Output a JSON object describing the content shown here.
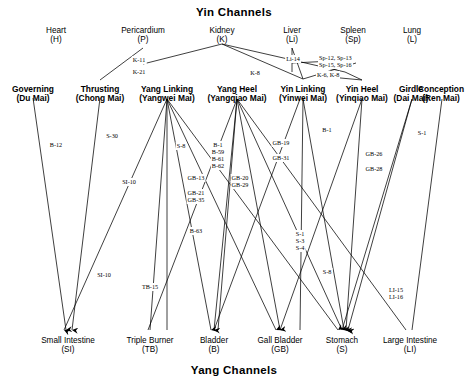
{
  "titles": {
    "top": "Yin Channels",
    "bottom": "Yang Channels"
  },
  "yin_organs": [
    {
      "id": "heart",
      "name": "Heart",
      "abbr": "(H)",
      "x": 56,
      "y": 30
    },
    {
      "id": "pericardium",
      "name": "Pericardium",
      "abbr": "(P)",
      "x": 143,
      "y": 30
    },
    {
      "id": "kidney",
      "name": "Kidney",
      "abbr": "(K)",
      "x": 222,
      "y": 30
    },
    {
      "id": "liver",
      "name": "Liver",
      "abbr": "(Li)",
      "x": 292,
      "y": 30
    },
    {
      "id": "spleen",
      "name": "Spleen",
      "abbr": "(Sp)",
      "x": 353,
      "y": 30
    },
    {
      "id": "lung",
      "name": "Lung",
      "abbr": "(L)",
      "x": 412,
      "y": 30
    }
  ],
  "vessels": [
    {
      "id": "governing",
      "name": "Governing",
      "alt": "(Du Mai)",
      "x": 33,
      "y": 88
    },
    {
      "id": "thrusting",
      "name": "Thrusting",
      "alt": "(Chong Mai)",
      "x": 100,
      "y": 88
    },
    {
      "id": "yang-linking",
      "name": "Yang Linking",
      "alt": "(Yangwei Mai)",
      "x": 167,
      "y": 88
    },
    {
      "id": "yang-heel",
      "name": "Yang Heel",
      "alt": "(Yangqiao Mai)",
      "x": 237,
      "y": 88
    },
    {
      "id": "yin-linking",
      "name": "Yin Linking",
      "alt": "(Yinwei Mai)",
      "x": 303,
      "y": 88
    },
    {
      "id": "yin-heel",
      "name": "Yin Heel",
      "alt": "(Yinqiao Mai)",
      "x": 362,
      "y": 88
    },
    {
      "id": "girdle",
      "name": "Girdle",
      "alt": "(Dai Mai)",
      "x": 412,
      "y": 88
    },
    {
      "id": "conception",
      "name": "Conception",
      "alt": "(Ren Mai)",
      "x": 442,
      "y": 88
    }
  ],
  "yang_organs": [
    {
      "id": "small-intestine",
      "name": "Small Intestine",
      "abbr": "(SI)",
      "x": 68,
      "y": 342
    },
    {
      "id": "triple-burner",
      "name": "Triple Burner",
      "abbr": "(TB)",
      "x": 150,
      "y": 342
    },
    {
      "id": "bladder",
      "name": "Bladder",
      "abbr": "(B)",
      "x": 214,
      "y": 342
    },
    {
      "id": "gall-bladder",
      "name": "Gall Bladder",
      "abbr": "(GB)",
      "x": 280,
      "y": 342
    },
    {
      "id": "stomach",
      "name": "Stomach",
      "abbr": "(S)",
      "x": 342,
      "y": 342
    },
    {
      "id": "large-intestine",
      "name": "Large Intestine",
      "abbr": "(LI)",
      "x": 410,
      "y": 342
    }
  ],
  "point_labels": [
    {
      "id": "k-11",
      "text": "K-11",
      "x": 139,
      "y": 59
    },
    {
      "id": "k-21",
      "text": "K-21",
      "x": 139,
      "y": 70
    },
    {
      "id": "k-8",
      "text": "K-8",
      "x": 255,
      "y": 71
    },
    {
      "id": "li-14",
      "text": "Li-14",
      "x": 293,
      "y": 57
    },
    {
      "id": "sp-12-13",
      "text": "Sp-12, Sp-13",
      "x": 344,
      "y": 56
    },
    {
      "id": "sp-15-16",
      "text": "Sp-15, Sp-16",
      "x": 344,
      "y": 63
    },
    {
      "id": "k-6-k-8",
      "text": "K-6, K-8",
      "x": 339,
      "y": 74
    },
    {
      "id": "b-12",
      "text": "B-12",
      "x": 56,
      "y": 143
    },
    {
      "id": "s-30",
      "text": "S-30",
      "x": 112,
      "y": 134
    },
    {
      "id": "si-10-upper",
      "text": "SI-10",
      "x": 129,
      "y": 180
    },
    {
      "id": "s-8",
      "text": "S-8",
      "x": 181,
      "y": 144
    },
    {
      "id": "b-1",
      "text": "B-1",
      "x": 218,
      "y": 143
    },
    {
      "id": "b-59",
      "text": "B-59",
      "x": 218,
      "y": 150
    },
    {
      "id": "b-61",
      "text": "B-61",
      "x": 218,
      "y": 157
    },
    {
      "id": "b-62",
      "text": "B-62",
      "x": 218,
      "y": 164
    },
    {
      "id": "gb-13",
      "text": "GB-13",
      "x": 196,
      "y": 176
    },
    {
      "id": "gb-21",
      "text": "GB-21",
      "x": 196,
      "y": 191
    },
    {
      "id": "gb-35",
      "text": "GB-35",
      "x": 196,
      "y": 198
    },
    {
      "id": "gb-20",
      "text": "GB-20",
      "x": 240,
      "y": 176
    },
    {
      "id": "gb-29",
      "text": "GB-29",
      "x": 240,
      "y": 183
    },
    {
      "id": "gb-19",
      "text": "GB-19",
      "x": 281,
      "y": 141
    },
    {
      "id": "gb-31",
      "text": "GB-31",
      "x": 281,
      "y": 156
    },
    {
      "id": "b-1-right",
      "text": "B-1",
      "x": 327,
      "y": 128
    },
    {
      "id": "gb-26",
      "text": "GB-26",
      "x": 374,
      "y": 152
    },
    {
      "id": "gb-28",
      "text": "GB-28",
      "x": 374,
      "y": 167
    },
    {
      "id": "s-1-right",
      "text": "S-1",
      "x": 422,
      "y": 131
    },
    {
      "id": "b-63",
      "text": "B-63",
      "x": 196,
      "y": 229
    },
    {
      "id": "s-1",
      "text": "S-1",
      "x": 300,
      "y": 232
    },
    {
      "id": "s-3",
      "text": "S-3",
      "x": 300,
      "y": 239
    },
    {
      "id": "s-4",
      "text": "S-4",
      "x": 300,
      "y": 246
    },
    {
      "id": "s-8-lower",
      "text": "S-8",
      "x": 327,
      "y": 270
    },
    {
      "id": "si-10-lower",
      "text": "SI-10",
      "x": 104,
      "y": 273
    },
    {
      "id": "tb-15",
      "text": "TB-15",
      "x": 150,
      "y": 285
    },
    {
      "id": "li-15",
      "text": "LI-15",
      "x": 396,
      "y": 288
    },
    {
      "id": "li-16",
      "text": "LI-16",
      "x": 396,
      "y": 295
    }
  ],
  "edges": [
    {
      "from": "thrusting-top",
      "x1": 100,
      "y1": 80,
      "x2": 143,
      "y2": 45
    },
    {
      "from": "kidney",
      "x1": 143,
      "y1": 63,
      "x2": 222,
      "y2": 44
    },
    {
      "from": "kidney-r",
      "x1": 222,
      "y1": 44,
      "x2": 330,
      "y2": 75
    },
    {
      "from": "kidney-r2",
      "x1": 222,
      "y1": 44,
      "x2": 303,
      "y2": 78
    },
    {
      "from": "liver-down",
      "x1": 292,
      "y1": 47,
      "x2": 303,
      "y2": 78
    },
    {
      "from": "liver-sp",
      "x1": 292,
      "y1": 62,
      "x2": 345,
      "y2": 72
    },
    {
      "from": "sp-cross",
      "x1": 303,
      "y1": 78,
      "x2": 353,
      "y2": 60
    },
    {
      "from": "yl-1",
      "x1": 167,
      "y1": 96,
      "x2": 62,
      "y2": 330
    },
    {
      "from": "yl-2",
      "x1": 167,
      "y1": 96,
      "x2": 150,
      "y2": 330
    },
    {
      "from": "yl-3",
      "x1": 167,
      "y1": 96,
      "x2": 214,
      "y2": 330
    },
    {
      "from": "yl-4",
      "x1": 167,
      "y1": 96,
      "x2": 280,
      "y2": 330
    },
    {
      "from": "yl-5",
      "x1": 167,
      "y1": 96,
      "x2": 342,
      "y2": 330
    },
    {
      "from": "yh-1",
      "x1": 237,
      "y1": 96,
      "x2": 214,
      "y2": 330
    },
    {
      "from": "yh-2",
      "x1": 237,
      "y1": 96,
      "x2": 280,
      "y2": 330
    },
    {
      "from": "yh-3",
      "x1": 237,
      "y1": 96,
      "x2": 342,
      "y2": 330
    },
    {
      "from": "yh-4",
      "x1": 237,
      "y1": 96,
      "x2": 150,
      "y2": 330
    },
    {
      "from": "yh-5",
      "x1": 237,
      "y1": 96,
      "x2": 410,
      "y2": 330
    },
    {
      "from": "yinl-1",
      "x1": 303,
      "y1": 96,
      "x2": 342,
      "y2": 330
    },
    {
      "from": "yinh-1",
      "x1": 362,
      "y1": 96,
      "x2": 342,
      "y2": 330
    },
    {
      "from": "gov-1",
      "x1": 33,
      "y1": 96,
      "x2": 68,
      "y2": 330
    },
    {
      "from": "thr-1",
      "x1": 100,
      "y1": 96,
      "x2": 68,
      "y2": 330
    },
    {
      "from": "gir-1",
      "x1": 412,
      "y1": 96,
      "x2": 342,
      "y2": 330
    },
    {
      "from": "con-1",
      "x1": 442,
      "y1": 96,
      "x2": 410,
      "y2": 330
    }
  ]
}
